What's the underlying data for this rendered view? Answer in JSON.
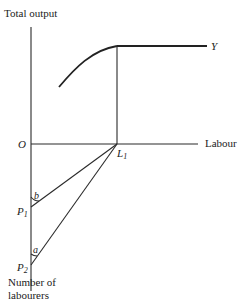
{
  "diagram": {
    "y_axis_label": "Total output",
    "x_axis_label": "Labour",
    "origin_label": "O",
    "curve_label": "Y",
    "labour_point": {
      "main": "L",
      "sub": "1"
    },
    "point_p1": {
      "main": "P",
      "sub": "1"
    },
    "point_p2": {
      "main": "P",
      "sub": "2"
    },
    "angle_b": "b",
    "angle_a": "a",
    "lower_axis_label_line1": "Number of",
    "lower_axis_label_line2": "labourers"
  }
}
